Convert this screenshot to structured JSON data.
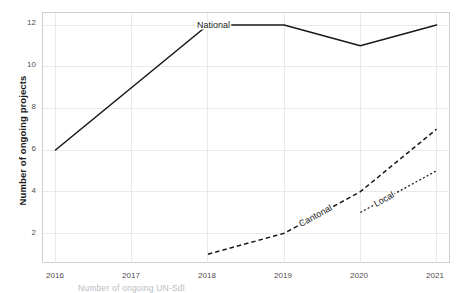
{
  "chart_data": {
    "type": "line",
    "title": "",
    "subtitle": "",
    "xlabel": "",
    "ylabel": "Number of ongoing projects",
    "x": [
      2016,
      2017,
      2018,
      2019,
      2020,
      2021
    ],
    "xtick_labels": [
      "2016",
      "2017",
      "2018",
      "2019",
      "2020",
      "2021"
    ],
    "ytick_labels": [
      "2",
      "4",
      "6",
      "8",
      "10",
      "12"
    ],
    "ytick_values": [
      2,
      4,
      6,
      8,
      10,
      12
    ],
    "xlim": [
      2016,
      2021
    ],
    "ylim": [
      0.6,
      12.6
    ],
    "grid": true,
    "legend_position": "inline-labels",
    "series": [
      {
        "name": "National",
        "label": "National",
        "style": "solid",
        "color": "#1a1a1a",
        "x": [
          2016,
          2017,
          2018,
          2019,
          2020,
          2021
        ],
        "values": [
          6,
          9,
          12,
          12,
          11,
          12
        ]
      },
      {
        "name": "Cantonal",
        "label": "Cantonal",
        "style": "dashed",
        "color": "#1a1a1a",
        "x": [
          2018,
          2019,
          2020,
          2021
        ],
        "values": [
          1,
          2,
          4,
          7
        ]
      },
      {
        "name": "Local",
        "label": "Local",
        "style": "dotted",
        "color": "#1a1a1a",
        "x": [
          2020,
          2021
        ],
        "values": [
          3,
          5
        ]
      }
    ],
    "annotations": [
      {
        "text": "National",
        "series": "National"
      },
      {
        "text": "Cantonal",
        "series": "Cantonal"
      },
      {
        "text": "Local",
        "series": "Local"
      }
    ]
  },
  "axis": {
    "y_title": "Number of ongoing projects",
    "y_ticks": [
      "12",
      "10",
      "8",
      "6",
      "4",
      "2"
    ],
    "x_ticks": [
      "2016",
      "2017",
      "2018",
      "2019",
      "2020",
      "2021"
    ]
  },
  "series_labels": {
    "national": "National",
    "cantonal": "Cantonal",
    "local": "Local"
  },
  "caption": {
    "text": "Number of ongoing UN-Sdl"
  },
  "colors": {
    "line": "#1a1a1a",
    "grid": "#e9e9ec",
    "panel_border": "#cfcfd4",
    "tick_text": "#4d4d4d",
    "title_text": "#1a1a1a",
    "caption_text": "#b9bcc4",
    "background": "#ffffff"
  }
}
